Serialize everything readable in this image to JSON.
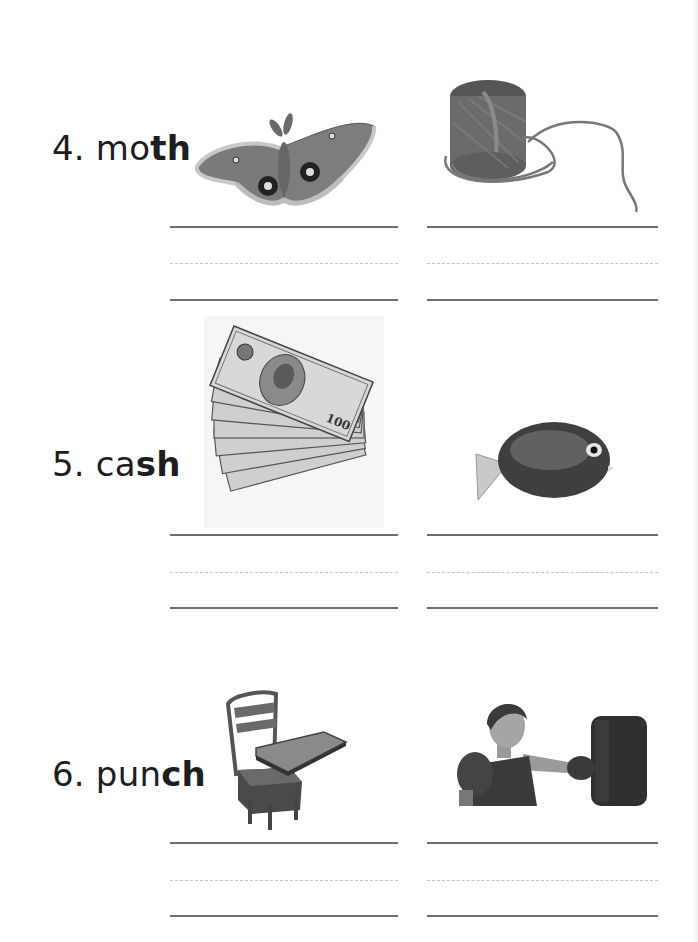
{
  "worksheet": {
    "items": [
      {
        "number": "4.",
        "prefix": "mo",
        "digraph": "th",
        "word": "moth",
        "pictures": [
          {
            "name": "moth",
            "description": "moth"
          },
          {
            "name": "twine",
            "description": "ball of twine / string"
          }
        ]
      },
      {
        "number": "5.",
        "prefix": "ca",
        "digraph": "sh",
        "word": "cash",
        "pictures": [
          {
            "name": "cash",
            "description": "fanned stack of 100 dollar bills"
          },
          {
            "name": "fish",
            "description": "tropical fish"
          }
        ]
      },
      {
        "number": "6.",
        "prefix": "pun",
        "digraph": "ch",
        "word": "punch",
        "pictures": [
          {
            "name": "desk",
            "description": "school desk chair"
          },
          {
            "name": "boxer",
            "description": "woman punching a punching bag"
          }
        ]
      }
    ],
    "bill_text": "100",
    "colors": {
      "text": "#1e1e1e",
      "solid_line": "#6e6e6e",
      "dashed_line": "#c4c4c4",
      "background": "#ffffff"
    }
  }
}
